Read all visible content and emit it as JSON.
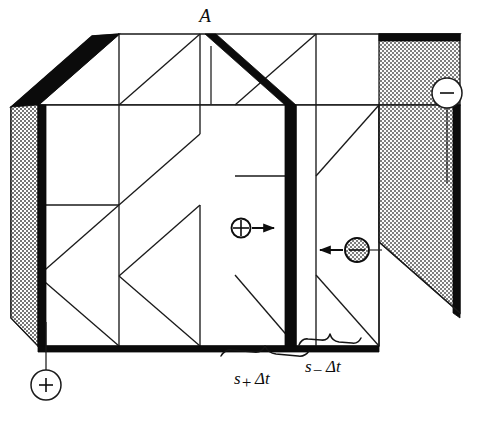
{
  "figure": {
    "background_color": "#ffffff",
    "ink_color": "#0d0d0d",
    "shade_color": "#9a9a9a"
  },
  "labels": {
    "area_label": "A",
    "positive_drift_var": "s",
    "positive_drift_sub": "+",
    "positive_drift_rest": "Δt",
    "negative_drift_var": "s",
    "negative_drift_sub": "−",
    "negative_drift_rest": "Δt",
    "positive_terminal": "+",
    "negative_terminal": "−"
  },
  "elements": {
    "left_electrode_name": "positive-electrode-plate",
    "right_electrode_name": "negative-electrode-plate",
    "cross_section_name": "cross-section-plane-A",
    "positive_carrier_name": "positive-charge-carrier",
    "negative_carrier_name": "negative-charge-carrier",
    "positive_arrow_direction": "right",
    "negative_arrow_direction": "left"
  },
  "diagram_data": {
    "type": "schematic",
    "description": "Isometric box-shaped conductor segment with a shaded positive electrode at the left-front and a shaded negative electrode at the right-rear. A thick black slab marks the cross-sectional area A at mid-length. A circled plus charge drifts right toward A; a circled minus charge drifts left toward A. Braces along the bottom front edge mark the slab distances s+ Δt to the left of A and s_ Δt to the right of A.",
    "annotations": [
      {
        "name": "area-callout",
        "text": "A",
        "target": "cross-section-plane"
      },
      {
        "name": "positive-drift-distance",
        "text": "s+ Δt",
        "side": "left-of-A"
      },
      {
        "name": "negative-drift-distance",
        "text": "s_ Δt",
        "side": "right-of-A"
      },
      {
        "name": "positive-terminal-callout",
        "text": "+",
        "position": "bottom-left"
      },
      {
        "name": "negative-terminal-callout",
        "text": "−",
        "position": "top-right"
      }
    ]
  }
}
